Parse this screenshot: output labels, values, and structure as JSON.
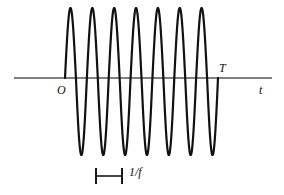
{
  "figure": {
    "background_color": "#ffffff",
    "width": 284,
    "height": 195
  },
  "axis": {
    "name": "time-axis",
    "orientation": "horizontal",
    "color": "#808080",
    "x_start": 14,
    "x_end": 272,
    "y": 78,
    "stroke_width": 2,
    "label": "t"
  },
  "markers": {
    "origin_label": "O",
    "origin_x": 65,
    "duration_label": "T",
    "duration_x": 218
  },
  "annotation": {
    "name": "period-measure",
    "label": "1/f",
    "bracket_left_x": 96,
    "bracket_right_x": 122,
    "bracket_y": 176,
    "cap_half_height": 8,
    "color": "#1a1a1a"
  },
  "chart_data": {
    "type": "line",
    "xlabel": "t",
    "ylabel": "",
    "grid": false,
    "legend": null,
    "series": [
      {
        "name": "sine-burst",
        "waveform": "sine",
        "cycles": 7,
        "amplitude": 70,
        "period_px": 21.9,
        "start_x": 65,
        "end_x": 218,
        "baseline_y": 78,
        "peak_y": 8,
        "trough_y": 155,
        "color": "#111111",
        "stroke_width": 2.2
      }
    ],
    "xlim": [
      14,
      272
    ],
    "ylim": [
      -1,
      1
    ],
    "annotations": [
      {
        "text": "O",
        "x": 61,
        "y": 90,
        "meaning": "origin"
      },
      {
        "text": "T",
        "x": 221,
        "y": 68,
        "meaning": "burst-duration"
      },
      {
        "text": "t",
        "x": 262,
        "y": 90,
        "meaning": "time-axis-label"
      },
      {
        "text": "1/f",
        "x": 135,
        "y": 176,
        "meaning": "period-equals-one-over-frequency"
      }
    ]
  }
}
